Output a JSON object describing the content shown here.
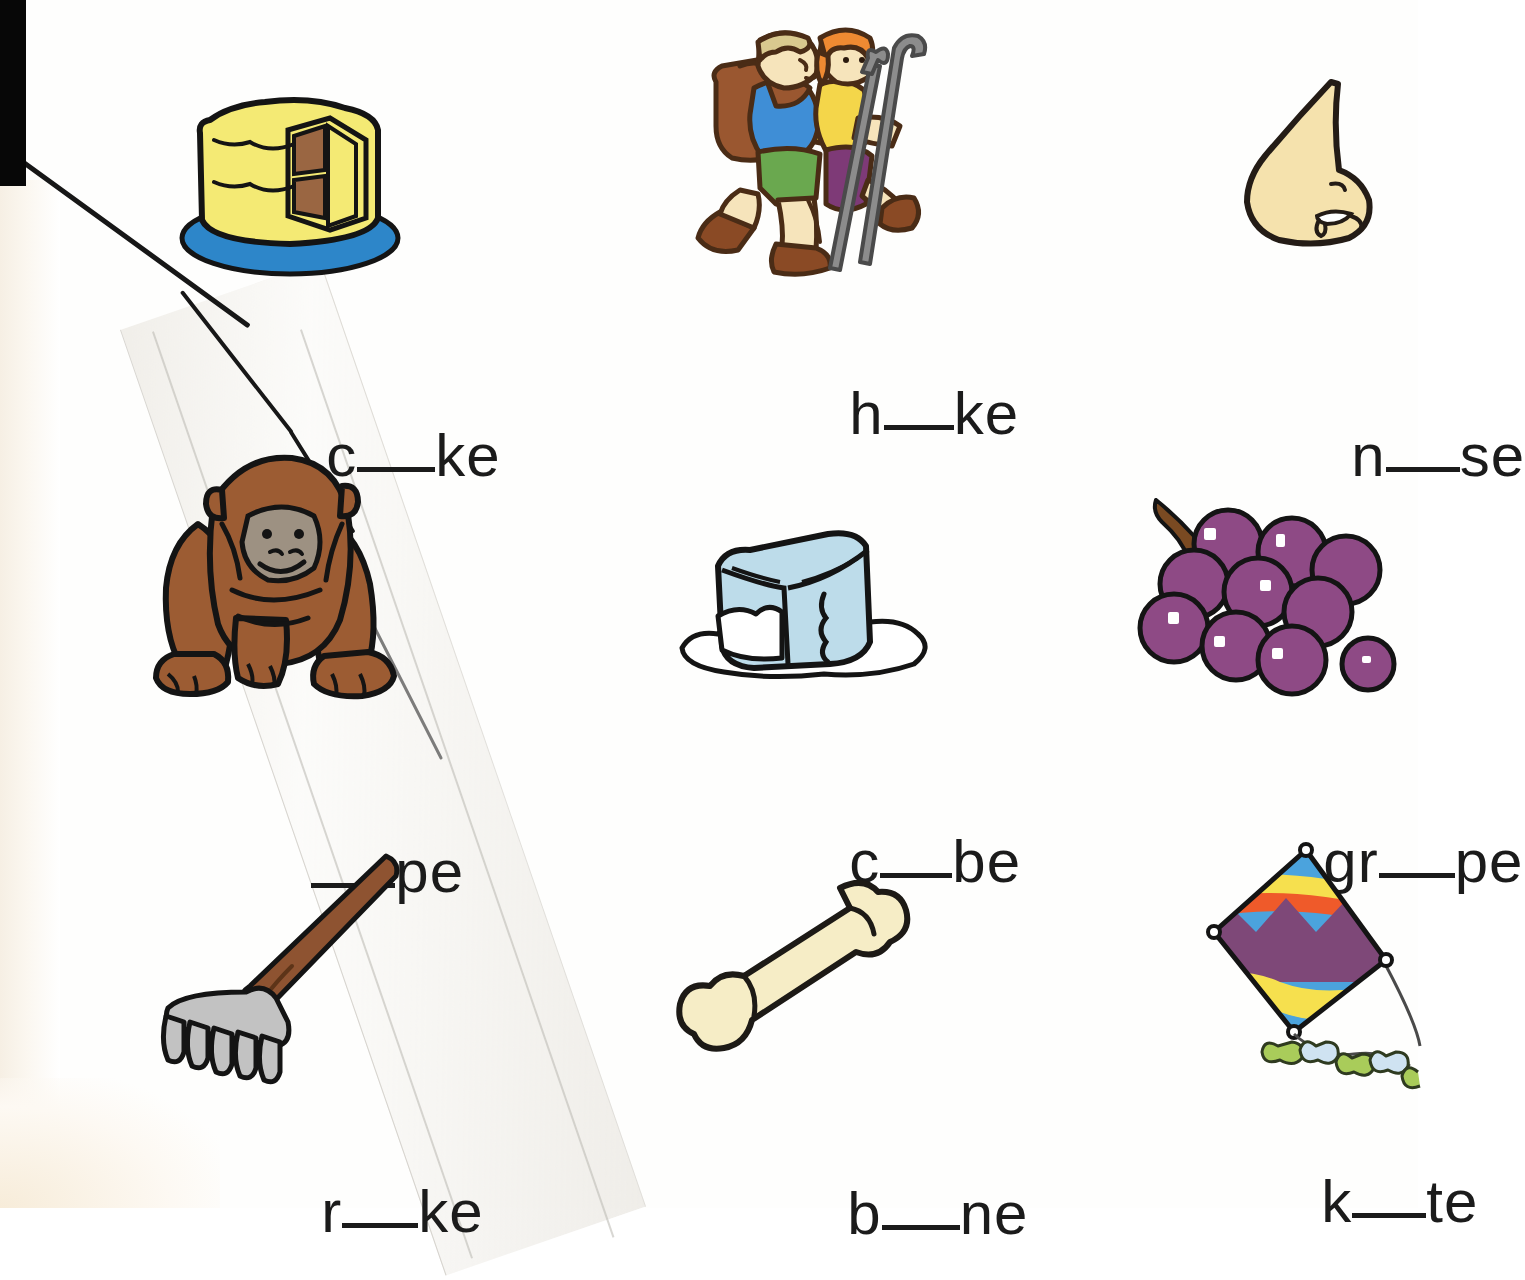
{
  "worksheet": {
    "type": "phonics-picture-word-worksheet",
    "rows": 3,
    "columns": 3,
    "background_color": "#ffffff",
    "text_color": "#1b1b1b"
  },
  "items": [
    {
      "id": "cake",
      "picture": "cake-illustration",
      "word_prefix": "c",
      "word_suffix": "ke",
      "blank": "__",
      "word_display": "c__ke",
      "answer_hint": "a",
      "colors": {
        "frosting": "#f4ea74",
        "plate": "#2d86c9",
        "filling": "#9a6642",
        "outline": "#141414"
      }
    },
    {
      "id": "hike",
      "picture": "hikers-illustration",
      "word_prefix": "h",
      "word_suffix": "ke",
      "blank": "__",
      "word_display": "h__ke",
      "answer_hint": "i",
      "colors": {
        "backpack": "#9a5730",
        "shirt_blue": "#3f8ed6",
        "shorts_green": "#6aa84f",
        "hair_orange": "#ef8a32",
        "shirt_yellow": "#f4d64a",
        "pants_purple": "#7e3a77",
        "skin": "#f6e4bb",
        "boots": "#8a4a25",
        "pole": "#8c8c8c"
      }
    },
    {
      "id": "nose",
      "picture": "nose-illustration",
      "word_prefix": "n",
      "word_suffix": "se",
      "blank": "__",
      "word_display": "n__se",
      "answer_hint": "o",
      "colors": {
        "skin": "#f5e2ad",
        "outline": "#241c16"
      }
    },
    {
      "id": "ape",
      "picture": "ape-illustration",
      "word_prefix": "",
      "word_suffix": "pe",
      "blank": "__",
      "word_display": "__pe",
      "answer_hint": "a",
      "colors": {
        "fur": "#9c5c33",
        "face": "#9d9182",
        "outline": "#141414"
      }
    },
    {
      "id": "cube",
      "picture": "ice-cube-illustration",
      "word_prefix": "c",
      "word_suffix": "be",
      "blank": "__",
      "word_display": "c__be",
      "answer_hint": "u",
      "colors": {
        "ice": "#bddcea",
        "puddle": "#ffffff",
        "outline": "#141414"
      }
    },
    {
      "id": "grape",
      "picture": "grapes-illustration",
      "word_prefix": "gr",
      "word_suffix": "pe",
      "blank": "__",
      "word_display": "gr__pe",
      "answer_hint": "a",
      "colors": {
        "grape": "#8e4a85",
        "stem": "#7a4a22",
        "outline": "#141414"
      }
    },
    {
      "id": "rake",
      "picture": "rake-illustration",
      "word_prefix": "r",
      "word_suffix": "ke",
      "blank": "__",
      "word_display": "r__ke",
      "answer_hint": "a",
      "colors": {
        "handle": "#8e5331",
        "head": "#c2c2c2",
        "outline": "#141414"
      }
    },
    {
      "id": "bone",
      "picture": "bone-illustration",
      "word_prefix": "b",
      "word_suffix": "ne",
      "blank": "__",
      "word_display": "b__ne",
      "answer_hint": "o",
      "colors": {
        "bone": "#f6edc6",
        "outline": "#1d1a16"
      }
    },
    {
      "id": "kite",
      "picture": "kite-illustration",
      "word_prefix": "k",
      "word_suffix": "te",
      "blank": "__",
      "word_display": "k__te",
      "answer_hint": "i",
      "colors": {
        "blue": "#4ba3dd",
        "yellow": "#f6e04e",
        "red": "#ef5a2a",
        "purple": "#7e4878",
        "bow_green": "#a9cc5a",
        "bow_blue": "#cfe3f2",
        "string": "#4a4a4a"
      }
    }
  ],
  "artifacts": {
    "black_edge": "scan-black-edge-top-left",
    "tear": "diagonal-tear-line",
    "tape": "diagonal-tape-strip"
  }
}
